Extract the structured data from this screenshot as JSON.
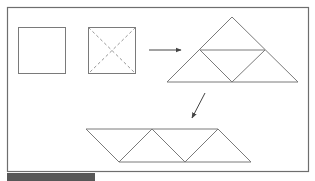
{
  "diagram": {
    "colors": {
      "stroke": "#7a7a7a",
      "frame": "#6e6e6e",
      "arrow": "#444444",
      "footer_bar": "#575757",
      "background": "#ffffff"
    },
    "frame": {
      "x": 7.5,
      "y": 7.5,
      "w": 301,
      "h": 164
    },
    "shapes": [
      {
        "id": "square-plain",
        "type": "rect",
        "x": 18.5,
        "y": 27.5,
        "w": 47,
        "h": 46
      },
      {
        "id": "square-cut",
        "type": "rect",
        "x": 88.5,
        "y": 27.5,
        "w": 47,
        "h": 46,
        "diagonals": "dashed"
      },
      {
        "id": "big-triangle",
        "type": "triangle",
        "apex": [
          232,
          17
        ],
        "base_left": [
          167,
          82
        ],
        "base_right": [
          298,
          82
        ],
        "midline": [
          [
            200,
            50
          ],
          [
            265,
            50
          ]
        ],
        "inner_bottom": [
          232,
          82
        ]
      },
      {
        "id": "parallelogram",
        "type": "parallelogram",
        "top": [
          [
            86,
            129
          ],
          [
            152,
            129
          ],
          [
            218,
            129
          ]
        ],
        "bottom": [
          [
            119,
            162
          ],
          [
            185,
            162
          ],
          [
            251,
            162
          ]
        ]
      }
    ],
    "arrows": [
      {
        "id": "arrow-right",
        "from": [
          149,
          50
        ],
        "to": [
          181,
          50
        ]
      },
      {
        "id": "arrow-down-left",
        "from": [
          205,
          93
        ],
        "to": [
          192,
          118
        ]
      }
    ]
  }
}
